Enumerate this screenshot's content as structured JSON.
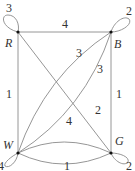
{
  "graph": {
    "type": "weighted multigraph with loops",
    "vertices": [
      {
        "id": "R",
        "label": "R",
        "x": 18,
        "y": 32,
        "loop_weight": "3"
      },
      {
        "id": "B",
        "label": "B",
        "x": 111,
        "y": 32,
        "loop_weight": "2"
      },
      {
        "id": "W",
        "label": "W",
        "x": 18,
        "y": 153,
        "loop_weight": "4"
      },
      {
        "id": "G",
        "label": "G",
        "x": 111,
        "y": 153,
        "loop_weight": "2"
      }
    ],
    "edges": [
      {
        "from": "R",
        "to": "B",
        "weight": "4",
        "shape": "straight"
      },
      {
        "from": "R",
        "to": "W",
        "weight": "1",
        "shape": "straight"
      },
      {
        "from": "B",
        "to": "G",
        "weight": "1",
        "shape": "straight"
      },
      {
        "from": "R",
        "to": "G",
        "weight": "2",
        "shape": "straight"
      },
      {
        "from": "W",
        "to": "B",
        "weight": "3",
        "shape": "curved-upper"
      },
      {
        "from": "W",
        "to": "B",
        "weight": "3",
        "shape": "curved-lower"
      },
      {
        "from": "W",
        "to": "G",
        "weight": "4",
        "shape": "curved-up"
      },
      {
        "from": "W",
        "to": "G",
        "weight": "1",
        "shape": "curved-down"
      }
    ]
  }
}
